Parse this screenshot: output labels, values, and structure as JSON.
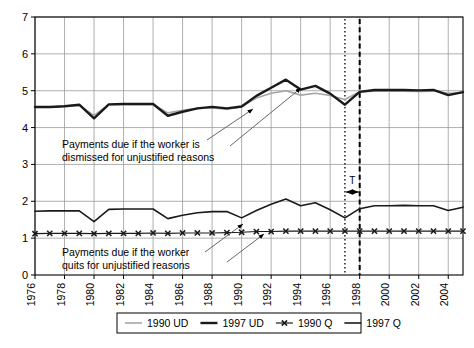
{
  "chart_data": {
    "type": "line",
    "title": "",
    "xlabel": "",
    "ylabel": "",
    "xlim": [
      1976,
      2005
    ],
    "ylim": [
      0,
      7
    ],
    "yticks": [
      0,
      1,
      2,
      3,
      4,
      5,
      6,
      7
    ],
    "xticks": [
      1976,
      1978,
      1980,
      1982,
      1984,
      1986,
      1988,
      1990,
      1992,
      1994,
      1996,
      1998,
      2000,
      2002,
      2004
    ],
    "grid": true,
    "legend_position": "bottom",
    "x": [
      1976,
      1977,
      1978,
      1979,
      1980,
      1981,
      1982,
      1983,
      1984,
      1985,
      1986,
      1987,
      1988,
      1989,
      1990,
      1991,
      1992,
      1993,
      1994,
      1995,
      1996,
      1997,
      1998,
      1999,
      2000,
      2001,
      2002,
      2003,
      2004,
      2005
    ],
    "series": [
      {
        "name": "1990 UD",
        "color": "#a6a6a6",
        "width": 1.6,
        "marker": "none",
        "values": [
          4.56,
          4.56,
          4.58,
          4.6,
          4.33,
          4.62,
          4.63,
          4.63,
          4.63,
          4.4,
          4.47,
          4.52,
          4.53,
          4.5,
          4.56,
          4.8,
          4.93,
          5.0,
          4.88,
          4.93,
          4.87,
          4.76,
          4.97,
          4.99,
          4.99,
          4.99,
          4.98,
          4.99,
          4.93,
          4.95
        ]
      },
      {
        "name": "1997 UD",
        "color": "#1a1a1a",
        "width": 2.4,
        "marker": "none",
        "values": [
          4.56,
          4.56,
          4.58,
          4.62,
          4.25,
          4.63,
          4.64,
          4.64,
          4.64,
          4.32,
          4.43,
          4.52,
          4.56,
          4.52,
          4.57,
          4.86,
          5.08,
          5.3,
          5.03,
          5.13,
          4.92,
          4.62,
          4.97,
          5.02,
          5.02,
          5.02,
          5.01,
          5.02,
          4.88,
          4.96
        ]
      },
      {
        "name": "1990 Q",
        "color": "#1a1a1a",
        "width": 1.2,
        "marker": "x",
        "values": [
          1.12,
          1.13,
          1.13,
          1.13,
          1.12,
          1.13,
          1.13,
          1.13,
          1.14,
          1.13,
          1.14,
          1.14,
          1.14,
          1.15,
          1.16,
          1.18,
          1.18,
          1.19,
          1.19,
          1.19,
          1.19,
          1.19,
          1.19,
          1.19,
          1.19,
          1.19,
          1.19,
          1.19,
          1.19,
          1.19
        ]
      },
      {
        "name": "1997 Q",
        "color": "#1a1a1a",
        "width": 1.6,
        "marker": "none",
        "values": [
          1.73,
          1.74,
          1.74,
          1.74,
          1.45,
          1.78,
          1.79,
          1.79,
          1.79,
          1.53,
          1.62,
          1.69,
          1.72,
          1.72,
          1.55,
          1.75,
          1.92,
          2.06,
          1.88,
          1.96,
          1.77,
          1.55,
          1.8,
          1.88,
          1.88,
          1.89,
          1.88,
          1.88,
          1.75,
          1.84
        ]
      }
    ],
    "annotations": [
      {
        "id": "dismissal-note",
        "lines": [
          "Payments due if the worker is",
          "dismissed for unjustified reasons"
        ]
      },
      {
        "id": "quit-note",
        "lines": [
          "Payments due if the worker",
          "quits for unjustified reasons"
        ]
      },
      {
        "id": "t-span",
        "label": "T",
        "from": 1997,
        "to": 1998
      }
    ],
    "vlines": [
      {
        "x": 1997,
        "style": "dotted"
      },
      {
        "x": 1998,
        "style": "dashed"
      }
    ]
  },
  "legend": {
    "items": [
      {
        "label": "1990 UD"
      },
      {
        "label": "1997 UD"
      },
      {
        "label": "1990 Q"
      },
      {
        "label": "1997 Q"
      }
    ]
  },
  "axes": {
    "y_tick_labels": [
      "0",
      "1",
      "2",
      "3",
      "4",
      "5",
      "6",
      "7"
    ],
    "x_tick_labels": [
      "1976",
      "1978",
      "1980",
      "1982",
      "1984",
      "1986",
      "1988",
      "1990",
      "1992",
      "1994",
      "1996",
      "1998",
      "2000",
      "2002",
      "2004"
    ]
  }
}
